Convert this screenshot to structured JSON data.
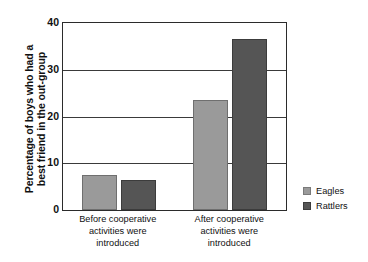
{
  "chart_data": {
    "type": "bar",
    "title": "",
    "xlabel": "",
    "ylabel": "Percentage of boys who had a best friend in the out-group",
    "ylabel_lines": [
      "Percentage of boys who had a",
      "best friend in the out-group"
    ],
    "categories": [
      "Before cooperative activities were introduced",
      "After cooperative activities were introduced"
    ],
    "category_lines": [
      [
        "Before cooperative",
        "activities were",
        "introduced"
      ],
      [
        "After cooperative",
        "activities were",
        "introduced"
      ]
    ],
    "series": [
      {
        "name": "Eagles",
        "values": [
          7.5,
          23.5
        ],
        "color": "#9a9a9a"
      },
      {
        "name": "Rattlers",
        "values": [
          6.5,
          36.5
        ],
        "color": "#555555"
      }
    ],
    "ylim": [
      0,
      40
    ],
    "yticks": [
      0,
      10,
      20,
      30,
      40
    ],
    "ytick_labels": [
      "0",
      "10",
      "20",
      "30",
      "40"
    ],
    "grid": true,
    "grid_axis": "y",
    "legend_position": "right",
    "legend": [
      {
        "label": "Eagles",
        "color": "#9a9a9a"
      },
      {
        "label": "Rattlers",
        "color": "#555555"
      }
    ]
  }
}
